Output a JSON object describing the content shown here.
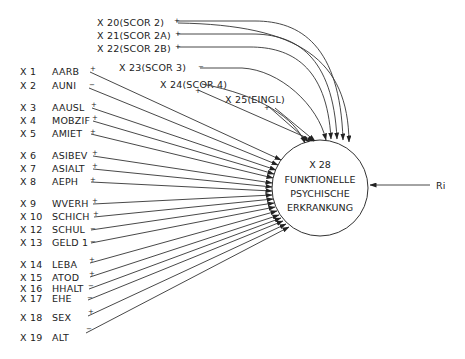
{
  "diagram": {
    "target": {
      "id": "X 28",
      "lines": [
        "FUNKTIONELLE",
        "PSYCHISCHE",
        "ERKRANKUNG"
      ]
    },
    "residual": {
      "label": "Ri"
    },
    "left_variables": [
      {
        "id": "X  1",
        "name": "AARB",
        "sign": "+"
      },
      {
        "id": "X  2",
        "name": "AUNI",
        "sign": "−"
      },
      {
        "id": "X  3",
        "name": "AAUSL",
        "sign": "+"
      },
      {
        "id": "X  4",
        "name": "MOBZIF",
        "sign": "+"
      },
      {
        "id": "X  5",
        "name": "AMIET",
        "sign": "+"
      },
      {
        "id": "X  6",
        "name": "ASIBEV",
        "sign": "+"
      },
      {
        "id": "X  7",
        "name": "ASIALT",
        "sign": "+"
      },
      {
        "id": "X  8",
        "name": "AEPH",
        "sign": "+"
      },
      {
        "id": "X  9",
        "name": "WVERH",
        "sign": "+"
      },
      {
        "id": "X 10",
        "name": "SCHICH",
        "sign": "+"
      },
      {
        "id": "X 12",
        "name": "SCHUL",
        "sign": "−"
      },
      {
        "id": "X 13",
        "name": "GELD 1",
        "sign": "−"
      },
      {
        "id": "X 14",
        "name": "LEBA",
        "sign": "+"
      },
      {
        "id": "X 15",
        "name": "ATOD",
        "sign": "+"
      },
      {
        "id": "X 16",
        "name": "HHALT",
        "sign": "−"
      },
      {
        "id": "X 17",
        "name": "EHE",
        "sign": "−"
      },
      {
        "id": "X 18",
        "name": "SEX",
        "sign": "+"
      },
      {
        "id": "X 19",
        "name": "ALT",
        "sign": "−"
      }
    ],
    "top_variables": [
      {
        "label": "X 20(SCOR 2)",
        "sign": "+"
      },
      {
        "label": "X 21(SCOR 2A)",
        "sign": "+"
      },
      {
        "label": "X 22(SCOR 2B)",
        "sign": "+"
      },
      {
        "label": "X 23(SCOR 3)",
        "sign": "−"
      },
      {
        "label": "X 24(SCOR 4)",
        "sign": "+"
      },
      {
        "label": "X 25(EINGL)",
        "sign": "+"
      }
    ]
  }
}
